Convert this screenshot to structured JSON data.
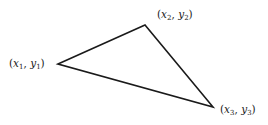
{
  "diagram": {
    "type": "triangle",
    "stroke_color": "#1a1a1a",
    "vertices": [
      {
        "id": "p1",
        "x": 58,
        "y": 64,
        "label_var_x": "x",
        "label_sub_x": "1",
        "label_var_y": "y",
        "label_sub_y": "1"
      },
      {
        "id": "p2",
        "x": 145,
        "y": 25,
        "label_var_x": "x",
        "label_sub_x": "2",
        "label_var_y": "y",
        "label_sub_y": "2"
      },
      {
        "id": "p3",
        "x": 213,
        "y": 107,
        "label_var_x": "x",
        "label_sub_x": "3",
        "label_var_y": "y",
        "label_sub_y": "3"
      }
    ],
    "punct": {
      "open": "(",
      "comma": ", ",
      "close": ")"
    }
  }
}
